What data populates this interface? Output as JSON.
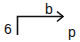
{
  "diagram": {
    "labels": {
      "start": "6",
      "edge": "b",
      "end": "p"
    },
    "connector": {
      "shape": "elbow-arrow",
      "direction": "up-then-right",
      "arrowhead": "open-chevron",
      "stroke_color": "#111111"
    }
  }
}
